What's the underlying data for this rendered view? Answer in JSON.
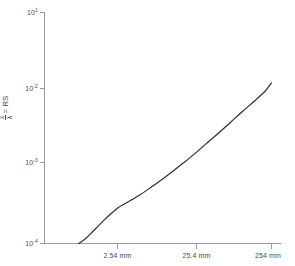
{
  "chart_data": {
    "type": "line",
    "title": "",
    "xlabel": "",
    "ylabel": "x/λ = RS",
    "ylabel_numerator": "x",
    "ylabel_denominator": "λ",
    "ylabel_equals": "= RS",
    "scale": {
      "x": "log",
      "y": "log"
    },
    "grid": false,
    "legend": null,
    "line_color": "#2b2b2b",
    "axis_color": "#9a9a9a",
    "text_color": "#4a4a4a",
    "background_color": "#ffffff",
    "xlim": [
      0.254,
      254
    ],
    "ylim": [
      0.0001,
      10
    ],
    "xticks": [
      {
        "value": 2.54,
        "label": "2.54 mm"
      },
      {
        "value": 25.4,
        "label": "25.4 mm"
      },
      {
        "value": 254,
        "label": "254 mm"
      }
    ],
    "yticks": [
      {
        "value": 10,
        "label": "10",
        "exponent": "1"
      },
      {
        "value": 0.01,
        "label": "10",
        "exponent": "-2"
      },
      {
        "value": 0.001,
        "label": "10",
        "exponent": "-3"
      },
      {
        "value": 0.0001,
        "label": "10",
        "exponent": "-4"
      }
    ],
    "series": [
      {
        "name": "curve",
        "x": [
          0.72,
          0.8,
          0.92,
          1.08,
          1.3,
          1.58,
          1.95,
          2.4,
          2.9,
          3.6,
          4.6,
          6.2,
          8.5,
          12.0,
          17.0,
          24.0,
          34.0,
          50.0,
          72.0,
          105.0,
          150.0,
          210.0,
          254.0
        ],
        "y": [
          0.0001,
          0.000112,
          0.000135,
          0.000175,
          0.000238,
          0.00033,
          0.000452,
          0.0006,
          0.00072,
          0.00088,
          0.00112,
          0.00156,
          0.00225,
          0.00345,
          0.0054,
          0.0085,
          0.014,
          0.024,
          0.041,
          0.072,
          0.12,
          0.2,
          0.3
        ]
      }
    ],
    "annotations": []
  }
}
